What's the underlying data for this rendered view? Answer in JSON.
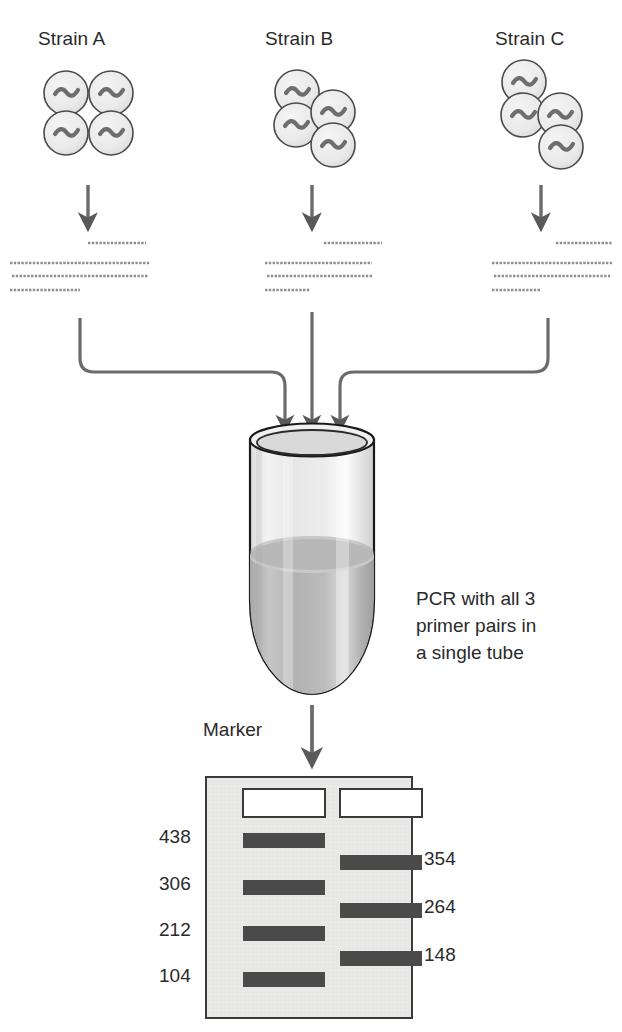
{
  "figure": {
    "background": "#ffffff",
    "line_color": "#58595b",
    "dark_ink": "#2a2a2a"
  },
  "strains": [
    {
      "id": "strain-a",
      "label": "Strain A",
      "label_x": 38,
      "label_y": 28,
      "colony_layout": "square-2x2",
      "cells": [
        {
          "cx": 66,
          "cy": 93
        },
        {
          "cx": 111,
          "cy": 93
        },
        {
          "cx": 66,
          "cy": 133
        },
        {
          "cx": 111,
          "cy": 133
        }
      ],
      "arrow": {
        "x": 88,
        "y1": 185,
        "y2": 226
      },
      "fragments": [
        {
          "x1": 88,
          "x2": 146,
          "y": 243
        },
        {
          "x1": 10,
          "x2": 150,
          "y": 263
        },
        {
          "x1": 12,
          "x2": 148,
          "y": 276
        },
        {
          "x1": 10,
          "x2": 80,
          "y": 290
        }
      ]
    },
    {
      "id": "strain-b",
      "label": "Strain B",
      "label_x": 265,
      "label_y": 28,
      "colony_layout": "staggered-offset",
      "cells": [
        {
          "cx": 297,
          "cy": 92
        },
        {
          "cx": 333,
          "cy": 112
        },
        {
          "cx": 296,
          "cy": 125
        },
        {
          "cx": 333,
          "cy": 145
        }
      ],
      "arrow": {
        "x": 312,
        "y1": 185,
        "y2": 226
      },
      "fragments": [
        {
          "x1": 324,
          "x2": 382,
          "y": 243
        },
        {
          "x1": 265,
          "x2": 372,
          "y": 263
        },
        {
          "x1": 267,
          "x2": 372,
          "y": 276
        },
        {
          "x1": 265,
          "x2": 310,
          "y": 290
        }
      ]
    },
    {
      "id": "strain-c",
      "label": "Strain C",
      "label_x": 495,
      "label_y": 28,
      "colony_layout": "diagonal-zigzag",
      "cells": [
        {
          "cx": 524,
          "cy": 82
        },
        {
          "cx": 523,
          "cy": 115
        },
        {
          "cx": 560,
          "cy": 115
        },
        {
          "cx": 561,
          "cy": 147
        }
      ],
      "arrow": {
        "x": 541,
        "y1": 185,
        "y2": 226
      },
      "fragments": [
        {
          "x1": 556,
          "x2": 612,
          "y": 243
        },
        {
          "x1": 492,
          "x2": 612,
          "y": 263
        },
        {
          "x1": 494,
          "x2": 610,
          "y": 276
        },
        {
          "x1": 492,
          "x2": 540,
          "y": 290
        }
      ]
    }
  ],
  "funnel": {
    "description": "three converging feed lines into tube mouth",
    "left_arrow": {
      "start_x": 80,
      "start_y": 320,
      "mid_y": 372,
      "end_x": 285,
      "end_y": 432
    },
    "center_arrow": {
      "start_x": 312,
      "start_y": 312,
      "end_x": 312,
      "end_y": 432
    },
    "right_arrow": {
      "start_x": 548,
      "start_y": 320,
      "mid_y": 372,
      "end_x": 340,
      "end_y": 432
    }
  },
  "tube": {
    "name": "pcr-tube",
    "rim_cx": 312,
    "rim_cy": 440,
    "rim_rx": 62,
    "rim_ry": 16,
    "body_top": 440,
    "body_bottom": 690,
    "liquid_level_y": 552,
    "glass_fill": "#eeeeee",
    "liquid_fill": "#b4b4b4",
    "outline": "#1a1a1a"
  },
  "pcr_note": {
    "lines": [
      "PCR with all 3",
      "primer pairs in",
      "a single tube"
    ]
  },
  "gel_arrow": {
    "x": 312,
    "y1": 703,
    "y2": 762
  },
  "gel": {
    "name": "agarose-gel",
    "marker_caption": "Marker",
    "marker_caption_x": 203,
    "marker_caption_y": 719,
    "box": {
      "x": 206,
      "y": 777,
      "w": 206,
      "h": 241
    },
    "background": "#e8e8e6",
    "border": "#3a3a3a",
    "band_color": "#4a4a4a",
    "well_color": "#ffffff",
    "lanes": [
      {
        "id": "marker-lane",
        "name": "Marker",
        "well": {
          "x": 243,
          "y": 789,
          "w": 82,
          "h": 28
        },
        "label_side": "left",
        "bands": [
          {
            "label": "438",
            "y": 833,
            "x": 243,
            "w": 82,
            "h": 15
          },
          {
            "label": "306",
            "y": 880,
            "x": 243,
            "w": 82,
            "h": 15
          },
          {
            "label": "212",
            "y": 926,
            "x": 243,
            "w": 82,
            "h": 15
          },
          {
            "label": "104",
            "y": 972,
            "x": 243,
            "w": 82,
            "h": 15
          }
        ]
      },
      {
        "id": "sample-lane",
        "name": "Sample",
        "well": {
          "x": 340,
          "y": 789,
          "w": 82,
          "h": 28
        },
        "label_side": "right",
        "bands": [
          {
            "label": "354",
            "y": 855,
            "x": 340,
            "w": 82,
            "h": 15
          },
          {
            "label": "264",
            "y": 903,
            "x": 340,
            "w": 82,
            "h": 15
          },
          {
            "label": "148",
            "y": 951,
            "x": 340,
            "w": 82,
            "h": 15
          }
        ]
      }
    ]
  }
}
